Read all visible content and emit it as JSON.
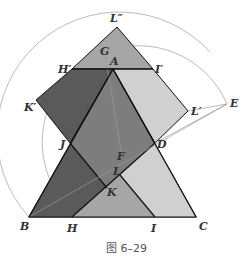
{
  "figure": {
    "caption": "图 6–29",
    "labels": {
      "Lpp": "L″",
      "G": "G",
      "Hp": "H′",
      "A": "A",
      "Ip": "I′",
      "Kp": "K′",
      "Lp": "L′",
      "E": "E",
      "J": "J",
      "D": "D",
      "F": "F",
      "L": "L",
      "K": "K",
      "B": "B",
      "H": "H",
      "I": "I",
      "C": "C"
    },
    "colors": {
      "dark": "#5a5a5a",
      "mid": "#7d7d7d",
      "light": "#a6a6a6",
      "pale": "#d0d0d0",
      "line": "#111111",
      "arc": "#999999"
    }
  }
}
